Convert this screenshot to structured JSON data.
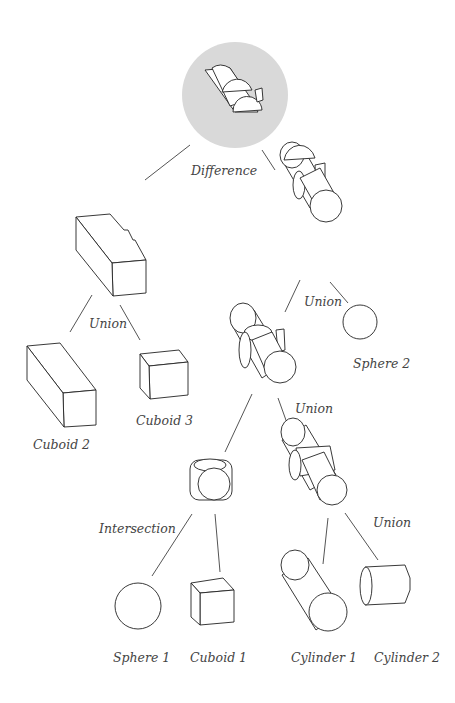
{
  "diagram": {
    "type": "CSG tree",
    "root": {
      "label": "Difference",
      "highlighted": true,
      "highlight_color": "#d9d9d9"
    },
    "nodes": [
      {
        "id": "difference",
        "label": "Difference"
      },
      {
        "id": "union_left",
        "label": "Union"
      },
      {
        "id": "union_right_top",
        "label": "Union"
      },
      {
        "id": "union_mid",
        "label": "Union"
      },
      {
        "id": "intersection",
        "label": "Intersection"
      },
      {
        "id": "union_cyl",
        "label": "Union"
      },
      {
        "id": "cuboid2",
        "label": "Cuboid 2"
      },
      {
        "id": "cuboid3",
        "label": "Cuboid 3"
      },
      {
        "id": "sphere2",
        "label": "Sphere 2"
      },
      {
        "id": "sphere1",
        "label": "Sphere 1"
      },
      {
        "id": "cuboid1",
        "label": "Cuboid 1"
      },
      {
        "id": "cylinder1",
        "label": "Cylinder 1"
      },
      {
        "id": "cylinder2",
        "label": "Cylinder 2"
      }
    ],
    "labels": {
      "difference": "Difference",
      "union_left": "Union",
      "union_right_top": "Union",
      "union_mid": "Union",
      "intersection": "Intersection",
      "union_cyl": "Union",
      "cuboid2": "Cuboid 2",
      "cuboid3": "Cuboid 3",
      "sphere2": "Sphere 2",
      "sphere1": "Sphere 1",
      "cuboid1": "Cuboid 1",
      "cylinder1": "Cylinder 1",
      "cylinder2": "Cylinder 2"
    },
    "edges": [
      [
        "difference",
        "union_left"
      ],
      [
        "difference",
        "union_right_top"
      ],
      [
        "union_left",
        "cuboid2"
      ],
      [
        "union_left",
        "cuboid3"
      ],
      [
        "union_right_top",
        "union_mid"
      ],
      [
        "union_right_top",
        "sphere2"
      ],
      [
        "union_mid",
        "intersection"
      ],
      [
        "union_mid",
        "union_cyl"
      ],
      [
        "intersection",
        "sphere1"
      ],
      [
        "intersection",
        "cuboid1"
      ],
      [
        "union_cyl",
        "cylinder1"
      ],
      [
        "union_cyl",
        "cylinder2"
      ]
    ]
  }
}
